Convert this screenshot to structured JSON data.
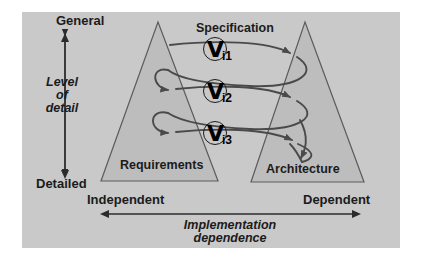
{
  "figure": {
    "background_color": "#c9c9c9",
    "page_color": "#ffffff",
    "line_color": "#4a4a4a",
    "text_color": "#1b1b1b",
    "triangle_fill": "#bdbdbd"
  },
  "axes": {
    "vertical": {
      "title_line1": "Level",
      "title_line2": "of",
      "title_line3": "detail",
      "top_label": "General",
      "bottom_label": "Detailed"
    },
    "horizontal": {
      "title_line1": "Implementation",
      "title_line2": "dependence",
      "left_label": "Independent",
      "right_label": "Dependent"
    }
  },
  "triangles": [
    {
      "name": "requirements",
      "label": "Requirements"
    },
    {
      "name": "architecture",
      "label": "Architecture"
    }
  ],
  "spiral": {
    "label": "Specification",
    "iterations": [
      {
        "id": "i1",
        "glyph": "V",
        "subscript": "i1"
      },
      {
        "id": "i2",
        "glyph": "V",
        "subscript": "i2"
      },
      {
        "id": "i3",
        "glyph": "V",
        "subscript": "i3"
      }
    ]
  }
}
